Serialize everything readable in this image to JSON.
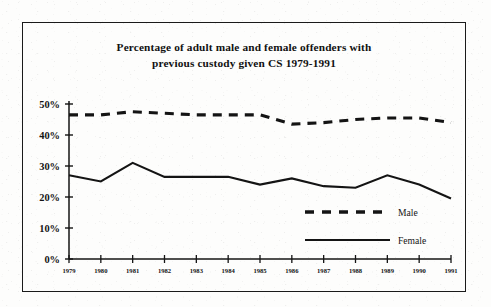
{
  "figure": {
    "title_line1": "Percentage of adult male and female offenders with",
    "title_line2": "previous custody given CS 1979-1991",
    "border_color": "#1a1a1a",
    "ink_color": "#141414",
    "background_color": "#fdfdfc"
  },
  "chart_data": {
    "type": "line",
    "title": "Percentage of adult male and female offenders with previous custody given CS 1979-1991",
    "xlabel": "",
    "ylabel": "",
    "categories": [
      "1979",
      "1980",
      "1981",
      "1982",
      "1983",
      "1984",
      "1985",
      "1986",
      "1987",
      "1988",
      "1989",
      "1990",
      "1991"
    ],
    "x": [
      1979,
      1980,
      1981,
      1982,
      1983,
      1984,
      1985,
      1986,
      1987,
      1988,
      1989,
      1990,
      1991
    ],
    "series": [
      {
        "name": "Male",
        "style": "dashed",
        "color": "#141414",
        "values": [
          46.5,
          46.5,
          47.5,
          47.0,
          46.5,
          46.5,
          46.5,
          43.5,
          44.0,
          45.0,
          45.5,
          45.5,
          44.0
        ]
      },
      {
        "name": "Female",
        "style": "solid",
        "color": "#141414",
        "values": [
          27.0,
          25.0,
          31.0,
          26.5,
          26.5,
          26.5,
          24.0,
          26.0,
          23.5,
          23.0,
          27.0,
          24.0,
          19.5
        ]
      }
    ],
    "ylim": [
      0,
      50
    ],
    "yticks": [
      0,
      10,
      20,
      30,
      40,
      50
    ],
    "ytick_labels": [
      "0%",
      "10%",
      "20%",
      "30%",
      "40%",
      "50%"
    ],
    "xlim": [
      1979,
      1991
    ],
    "grid": false,
    "legend_position": "inside-lower-right",
    "legend_entries": [
      {
        "label": "Male",
        "style": "dashed"
      },
      {
        "label": "Female",
        "style": "solid"
      }
    ]
  }
}
